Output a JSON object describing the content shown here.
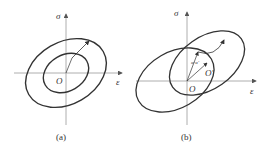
{
  "panels": [
    {
      "id": "a",
      "caption": "(a)",
      "y_axis_label": "σ",
      "x_axis_label": "ε",
      "origin_label": "O",
      "description": "Two concentric ellipses centered at origin O, with arrow showing expansion from inner to outer ellipse"
    },
    {
      "id": "b",
      "caption": "(b)",
      "y_axis_label": "σ",
      "x_axis_label": "ε",
      "origin_label": "O",
      "shifted_center_label": "O'",
      "vector_label": "α-α'",
      "description": "Initial ellipse centered at O and translated/expanded ellipse centered at O', with back-stress vector and expansion arrow"
    }
  ],
  "colors": {
    "curve": "#333333",
    "axis": "#999999"
  }
}
